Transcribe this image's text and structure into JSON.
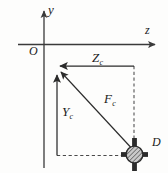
{
  "figure": {
    "background_color": "#fdfdfc",
    "line_color": "#3a3a3a",
    "axes": {
      "origin_label": "O",
      "vertical_axis_label": "y",
      "horizontal_axis_label": "z"
    },
    "labels": {
      "origin": "O",
      "y_axis": "y",
      "z_axis": "z",
      "z_component_base": "Z",
      "z_component_sub": "c",
      "y_component_base": "Y",
      "y_component_sub": "c",
      "force_base": "F",
      "force_sub": "c",
      "point": "D"
    },
    "elements": {
      "support_marker": "hatched-circle-cross-marker",
      "vectors": [
        "Zc-horizontal-arrow",
        "Yc-vertical-arrow",
        "Fc-diagonal-arrow"
      ],
      "dashed_guides": [
        "horizontal-projection",
        "vertical-projection"
      ]
    }
  }
}
